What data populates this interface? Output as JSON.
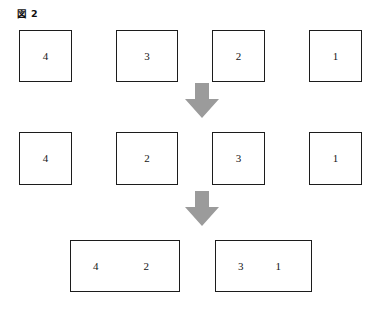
{
  "figure": {
    "title": "図 2",
    "background_color": "#ffffff",
    "box_border_color": "#1c1c1c",
    "box_fill_color": "#ffffff",
    "arrow_color": "#9b9b9b",
    "text_color": "#141414"
  },
  "rows": [
    {
      "name": "row-initial",
      "boxes": [
        {
          "label": "4",
          "x": 19,
          "y": 30,
          "w": 53,
          "h": 52
        },
        {
          "label": "3",
          "x": 116,
          "y": 30,
          "w": 62,
          "h": 52
        },
        {
          "label": "2",
          "x": 212,
          "y": 30,
          "w": 53,
          "h": 52
        },
        {
          "label": "1",
          "x": 309,
          "y": 30,
          "w": 53,
          "h": 52
        }
      ]
    },
    {
      "name": "row-swapped",
      "boxes": [
        {
          "label": "4",
          "x": 19,
          "y": 132,
          "w": 53,
          "h": 53
        },
        {
          "label": "2",
          "x": 116,
          "y": 132,
          "w": 62,
          "h": 53
        },
        {
          "label": "3",
          "x": 212,
          "y": 132,
          "w": 53,
          "h": 53
        },
        {
          "label": "1",
          "x": 309,
          "y": 132,
          "w": 53,
          "h": 53
        }
      ]
    },
    {
      "name": "row-merged",
      "boxes": [
        {
          "label": "4",
          "label2": "2",
          "x": 70,
          "y": 240,
          "w": 110,
          "h": 52
        },
        {
          "label": "3",
          "label2": "1",
          "x": 215,
          "y": 240,
          "w": 97,
          "h": 52
        }
      ]
    }
  ],
  "arrows": [
    {
      "name": "arrow-step-1",
      "x": 185,
      "y": 83,
      "w": 34,
      "h": 35
    },
    {
      "name": "arrow-step-2",
      "x": 185,
      "y": 191,
      "w": 34,
      "h": 35
    }
  ]
}
